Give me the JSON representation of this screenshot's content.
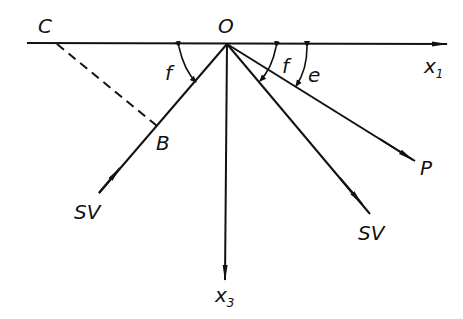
{
  "diagram": {
    "origin_label": "O",
    "points": {
      "C": "C",
      "B": "B"
    },
    "axes": {
      "x1": {
        "base": "x",
        "sub": "1"
      },
      "x3": {
        "base": "x",
        "sub": "3"
      }
    },
    "rays": {
      "incident_sv": "SV",
      "reflected_p": "P",
      "reflected_sv": "SV"
    },
    "angles": {
      "incident_angle": "f",
      "reflected_sv_angle": "f",
      "reflected_p_angle": "e"
    }
  }
}
